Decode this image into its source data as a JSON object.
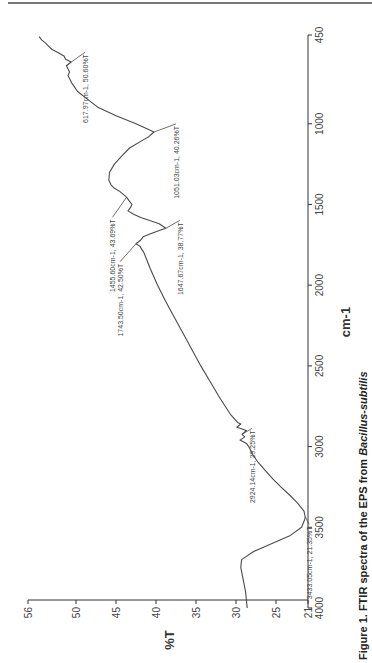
{
  "figure": {
    "caption_prefix": "Figure 1. FTIR spectra of the EPS from ",
    "caption_species": "Bacillus-subtilis"
  },
  "chart_data": {
    "type": "line",
    "title": "FTIR spectra of the EPS from Bacillus-subtilis",
    "orientation": "rotated-90-clockwise",
    "xlabel": "cm-1",
    "ylabel": "%T",
    "xlim": [
      4000,
      450
    ],
    "ylim": [
      21,
      56
    ],
    "x_ticks": [
      4000,
      3500,
      3000,
      2500,
      2000,
      1500,
      1000,
      450
    ],
    "y_ticks": [
      21,
      25,
      30,
      35,
      40,
      45,
      50,
      56
    ],
    "grid": false,
    "legend": null,
    "series": [
      {
        "name": "EPS FTIR",
        "x": [
          4000,
          3900,
          3800,
          3750,
          3700,
          3650,
          3600,
          3550,
          3500,
          3450,
          3433,
          3400,
          3350,
          3300,
          3250,
          3200,
          3150,
          3100,
          3050,
          3000,
          2980,
          2960,
          2940,
          2924,
          2900,
          2880,
          2860,
          2850,
          2800,
          2700,
          2600,
          2500,
          2400,
          2300,
          2200,
          2100,
          2000,
          1900,
          1800,
          1760,
          1743,
          1720,
          1700,
          1680,
          1660,
          1647,
          1620,
          1600,
          1580,
          1560,
          1540,
          1520,
          1500,
          1480,
          1455,
          1420,
          1400,
          1380,
          1350,
          1300,
          1250,
          1200,
          1150,
          1100,
          1080,
          1051,
          1030,
          1000,
          950,
          900,
          850,
          800,
          750,
          700,
          680,
          660,
          640,
          617,
          600,
          580,
          560,
          540,
          520,
          500,
          480,
          460
        ],
        "y": [
          28.6,
          28.8,
          29.2,
          29.4,
          29.3,
          27.8,
          25.5,
          23.2,
          21.8,
          21.4,
          21.35,
          21.5,
          22.3,
          23.3,
          24.4,
          25.4,
          26.3,
          27.2,
          27.9,
          28.4,
          28.7,
          29.5,
          28.9,
          29.25,
          28.7,
          29.9,
          29.4,
          29.8,
          30.7,
          32.0,
          33.2,
          34.4,
          35.5,
          36.6,
          37.7,
          38.8,
          39.8,
          40.7,
          41.5,
          42.0,
          42.5,
          41.9,
          41.6,
          40.6,
          39.5,
          38.77,
          39.6,
          40.8,
          41.9,
          42.8,
          43.5,
          43.2,
          43.0,
          43.3,
          43.69,
          44.5,
          45.2,
          45.6,
          45.9,
          45.8,
          45.2,
          44.3,
          43.3,
          41.6,
          40.9,
          40.26,
          41.2,
          42.5,
          45.0,
          47.2,
          48.5,
          49.8,
          50.5,
          51.0,
          50.8,
          51.0,
          51.2,
          50.6,
          51.3,
          51.5,
          52.2,
          53.0,
          53.4,
          53.8,
          54.3,
          54.6
        ]
      }
    ],
    "annotations": [
      {
        "label": "3433.05cm-1, 21.35%T",
        "x": 3433.05,
        "y": 21.35
      },
      {
        "label": "2924.14cm-1, 29.25%T",
        "x": 2924.14,
        "y": 29.25
      },
      {
        "label": "1743.50cm-1, 42.50%T",
        "x": 1743.5,
        "y": 42.5
      },
      {
        "label": "1647.67cm-1, 38.77%T",
        "x": 1647.67,
        "y": 38.77
      },
      {
        "label": "1455.60cm-1, 43.69%T",
        "x": 1455.6,
        "y": 43.69
      },
      {
        "label": "1051.03cm-1, 40.26%T",
        "x": 1051.03,
        "y": 40.26
      },
      {
        "label": "617.97cm-1, 50.60%T",
        "x": 617.97,
        "y": 50.6
      }
    ]
  },
  "colors": {
    "line": "#4a4a4a",
    "axis": "#333333",
    "text": "#444444"
  }
}
